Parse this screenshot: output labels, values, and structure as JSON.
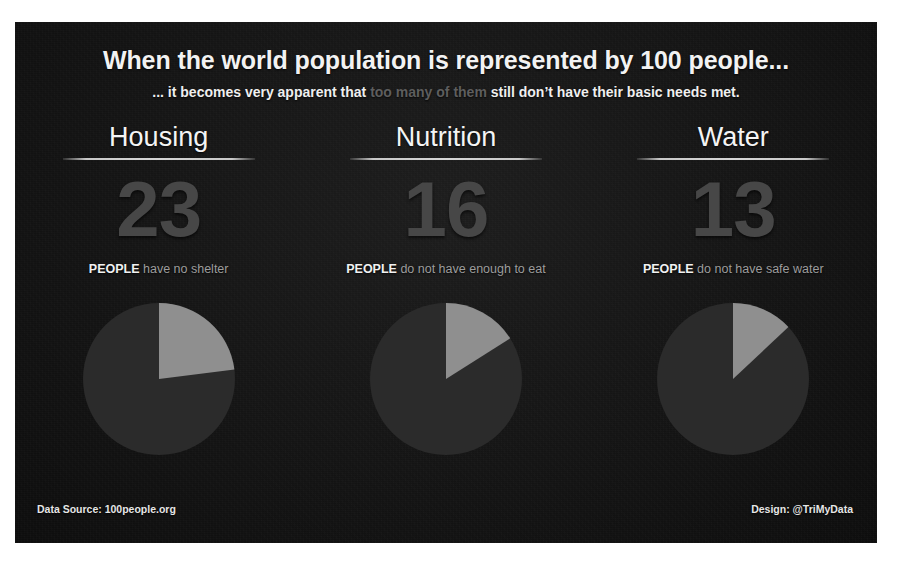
{
  "poster": {
    "title": "When the world population is represented by 100 people...",
    "subtitle_parts": {
      "lead": "... it becomes very apparent that ",
      "dim": "too many of them",
      "tail": " still don’t have their basic needs met."
    },
    "background_color": "#141414",
    "accent_color": "#8f8f8f",
    "number_color": "#474747"
  },
  "columns": [
    {
      "title": "Housing",
      "value": "23",
      "caption_keyword": "PEOPLE",
      "caption_rest": " have no shelter"
    },
    {
      "title": "Nutrition",
      "value": "16",
      "caption_keyword": "PEOPLE",
      "caption_rest": " do not have enough to eat"
    },
    {
      "title": "Water",
      "value": "13",
      "caption_keyword": "PEOPLE",
      "caption_rest": " do not have safe water"
    }
  ],
  "footer": {
    "source": "Data Source: 100people.org",
    "design": "Design: @TriMyData"
  },
  "chart_data": [
    {
      "type": "pie",
      "title": "Housing",
      "labels": [
        "People with no shelter",
        "People with shelter"
      ],
      "values": [
        23,
        77
      ],
      "colors": [
        "#8f8f8f",
        "#2b2b2b"
      ],
      "start_angle_deg": 0,
      "direction": "clockwise",
      "units": "people per 100",
      "legend": "none"
    },
    {
      "type": "pie",
      "title": "Nutrition",
      "labels": [
        "People without enough to eat",
        "People with enough to eat"
      ],
      "values": [
        16,
        84
      ],
      "colors": [
        "#8f8f8f",
        "#2b2b2b"
      ],
      "start_angle_deg": 0,
      "direction": "clockwise",
      "units": "people per 100",
      "legend": "none"
    },
    {
      "type": "pie",
      "title": "Water",
      "labels": [
        "People without safe water",
        "People with safe water"
      ],
      "values": [
        13,
        87
      ],
      "colors": [
        "#8f8f8f",
        "#2b2b2b"
      ],
      "start_angle_deg": 0,
      "direction": "clockwise",
      "units": "people per 100",
      "legend": "none"
    }
  ]
}
